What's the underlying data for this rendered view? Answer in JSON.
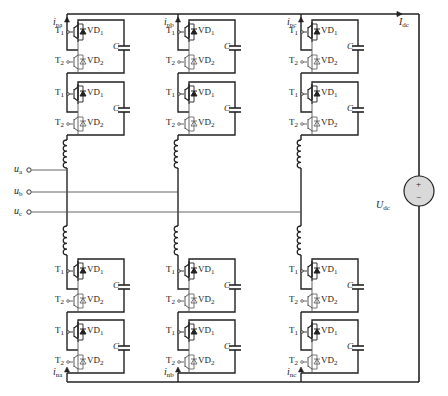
{
  "diagram": {
    "type": "modular-multilevel-converter",
    "colors": {
      "wire": "#222222",
      "thin_wire": "#555555",
      "source_fill": "#d9d9d9"
    },
    "phases": [
      {
        "id": "a",
        "x": 67,
        "upper_current": "i",
        "upper_current_sub": "pa",
        "lower_current": "i",
        "lower_current_sub": "na",
        "input": "u",
        "input_sub": "a",
        "input_y": 170
      },
      {
        "id": "b",
        "x": 178,
        "upper_current": "i",
        "upper_current_sub": "pb",
        "lower_current": "i",
        "lower_current_sub": "nb",
        "input": "u",
        "input_sub": "b",
        "input_y": 192
      },
      {
        "id": "c",
        "x": 301,
        "upper_current": "i",
        "upper_current_sub": "pc",
        "lower_current": "i",
        "lower_current_sub": "nc",
        "input": "u",
        "input_sub": "c",
        "input_y": 212
      }
    ],
    "submodule": {
      "t1": "T",
      "t1_sub": "1",
      "t2": "T",
      "t2_sub": "2",
      "vd1": "VD",
      "vd1_sub": "1",
      "vd2": "VD",
      "vd2_sub": "2",
      "cap": "C"
    },
    "submodule_rows_y": [
      18,
      80,
      257,
      318
    ],
    "dc": {
      "current": "I",
      "current_sub": "dc",
      "voltage": "U",
      "voltage_sub": "dc",
      "plus": "+",
      "minus": "−"
    }
  }
}
